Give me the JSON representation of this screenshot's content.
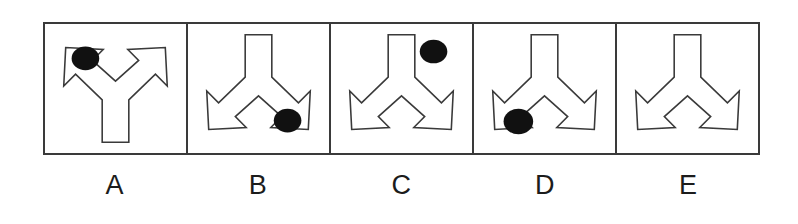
{
  "figure": {
    "type": "multiple-choice-shape-panel",
    "panel_count": 5,
    "frame_color": "#3a3a3a",
    "background_color": "#ffffff",
    "outline_color": "#3a3a3a",
    "dot_color": "#111111"
  },
  "panels": [
    {
      "label": "A",
      "shape_name": "bifurcated-arrow",
      "orientation": "up",
      "rotation_degrees": 180,
      "dot_present": true,
      "dot_position": "upper-left",
      "dot_inside_shape": true,
      "dot_cx": 41,
      "dot_cy": 34,
      "dot_rx": 14,
      "dot_ry": 12
    },
    {
      "label": "B",
      "shape_name": "bifurcated-arrow",
      "orientation": "down",
      "rotation_degrees": 0,
      "dot_present": true,
      "dot_position": "lower-right",
      "dot_inside_shape": true,
      "dot_cx": 101,
      "dot_cy": 97,
      "dot_rx": 14,
      "dot_ry": 12
    },
    {
      "label": "C",
      "shape_name": "bifurcated-arrow",
      "orientation": "down",
      "rotation_degrees": 0,
      "dot_present": true,
      "dot_position": "upper-right",
      "dot_inside_shape": false,
      "dot_cx": 104,
      "dot_cy": 27,
      "dot_rx": 14,
      "dot_ry": 12
    },
    {
      "label": "D",
      "shape_name": "bifurcated-arrow",
      "orientation": "down",
      "rotation_degrees": 0,
      "dot_present": true,
      "dot_position": "lower-left",
      "dot_inside_shape": true,
      "dot_cx": 45,
      "dot_cy": 98,
      "dot_rx": 15,
      "dot_ry": 13
    },
    {
      "label": "E",
      "shape_name": "bifurcated-arrow",
      "orientation": "down",
      "rotation_degrees": 0,
      "dot_present": false,
      "dot_position": "",
      "dot_inside_shape": false,
      "dot_cx": 0,
      "dot_cy": 0,
      "dot_rx": 0,
      "dot_ry": 0
    }
  ]
}
